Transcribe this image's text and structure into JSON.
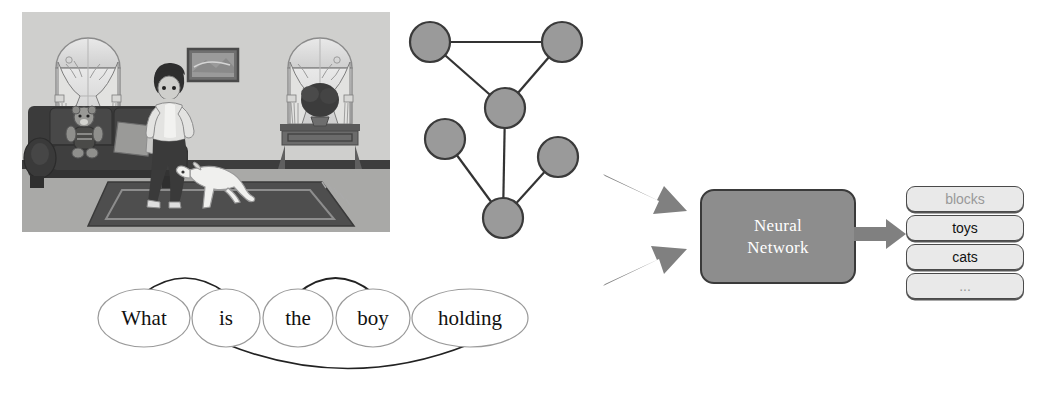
{
  "figure": {
    "scene": {
      "alt": "living room with boy, dog, sofa, teddy bear, windows and plant",
      "elements": [
        "window-left",
        "window-right",
        "picture-frame",
        "sofa",
        "teddy-bear",
        "pillow",
        "boy",
        "dog",
        "rug",
        "console-table",
        "potted-plant"
      ]
    },
    "scene_graph": {
      "node_count": 6,
      "nodes": [
        {
          "id": "n1",
          "cx": 30,
          "cy": 34,
          "r": 20
        },
        {
          "id": "n2",
          "cx": 162,
          "cy": 34,
          "r": 20
        },
        {
          "id": "n3",
          "cx": 105,
          "cy": 100,
          "r": 20
        },
        {
          "id": "n4",
          "cx": 45,
          "cy": 131,
          "r": 20
        },
        {
          "id": "n5",
          "cx": 158,
          "cy": 149,
          "r": 20
        },
        {
          "id": "n6",
          "cx": 103,
          "cy": 210,
          "r": 20
        }
      ],
      "edges": [
        [
          "n1",
          "n2"
        ],
        [
          "n1",
          "n3"
        ],
        [
          "n2",
          "n3"
        ],
        [
          "n3",
          "n6"
        ],
        [
          "n4",
          "n6"
        ],
        [
          "n5",
          "n6"
        ]
      ],
      "node_fill": "#9a9a9a",
      "node_stroke": "#3a3a3a",
      "edge_color": "#333333"
    },
    "question_graph": {
      "words": [
        {
          "text": "What",
          "cx": 64,
          "cy": 50,
          "rx": 46,
          "ry": 29
        },
        {
          "text": "is",
          "cx": 146,
          "cy": 50,
          "rx": 34,
          "ry": 29
        },
        {
          "text": "the",
          "cx": 218,
          "cy": 50,
          "rx": 35,
          "ry": 29
        },
        {
          "text": "boy",
          "cx": 293,
          "cy": 50,
          "rx": 37,
          "ry": 29
        },
        {
          "text": "holding",
          "cx": 390,
          "cy": 50,
          "rx": 58,
          "ry": 29
        }
      ],
      "dependency_arcs": [
        {
          "from": "What",
          "to": "is",
          "position": "above"
        },
        {
          "from": "the",
          "to": "boy",
          "position": "above"
        },
        {
          "from": "is",
          "to": "holding",
          "position": "below"
        }
      ],
      "ellipse_stroke": "#9a9a9a",
      "arc_color": "#222222"
    },
    "arrows": {
      "color": "#808080",
      "items": [
        {
          "name": "image-to-network-arrow",
          "direction": "down-right"
        },
        {
          "name": "question-to-network-arrow",
          "direction": "up-right"
        },
        {
          "name": "network-to-answers-arrow",
          "direction": "right"
        }
      ]
    },
    "model": {
      "label_line1": "Neural",
      "label_line2": "Network",
      "fill": "#8d8d8d",
      "stroke": "#3a3a3a",
      "text_color": "#ffffff"
    },
    "answers": {
      "items": [
        {
          "label": "blocks",
          "dim": true
        },
        {
          "label": "toys",
          "dim": false
        },
        {
          "label": "cats",
          "dim": false
        },
        {
          "label": "...",
          "dim": true
        }
      ],
      "box_fill": "#e9e9e9",
      "box_stroke": "#4a4a4a",
      "dim_text_color": "#999999",
      "text_color": "#111111"
    }
  }
}
